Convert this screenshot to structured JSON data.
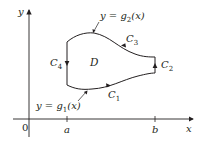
{
  "figure": {
    "colors": {
      "ink": "#231f20",
      "background": "#ffffff"
    },
    "axes": {
      "x_label": "x",
      "y_label": "y",
      "origin_label": "0",
      "x_ticks": [
        "a",
        "b"
      ]
    },
    "region_label": "D",
    "curves": {
      "upper": {
        "label_prefix": "y = g",
        "subscript": "2",
        "label_suffix": "(x)"
      },
      "lower": {
        "label_prefix": "y = g",
        "subscript": "1",
        "label_suffix": "(x)"
      }
    },
    "boundary": {
      "c1": {
        "letter": "C",
        "sub": "1"
      },
      "c2": {
        "letter": "C",
        "sub": "2"
      },
      "c3": {
        "letter": "C",
        "sub": "3"
      },
      "c4": {
        "letter": "C",
        "sub": "4"
      }
    }
  }
}
